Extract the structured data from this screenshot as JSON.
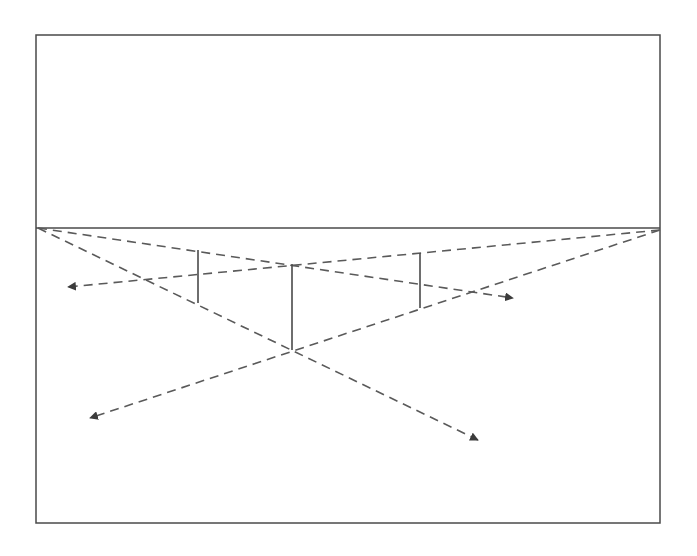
{
  "diagram": {
    "colors": {
      "background": "#ffffff",
      "frame": "#4a4a4a",
      "line": "#5a5a5a",
      "arrow": "#3c3c3c"
    },
    "frame": {
      "x": 36,
      "y": 35,
      "width": 624,
      "height": 488
    },
    "horizon": {
      "y": 228,
      "x1": 36,
      "x2": 660
    },
    "vanishing_points": [
      {
        "name": "left",
        "x": 38,
        "y": 228
      },
      {
        "name": "right",
        "x": 660,
        "y": 230
      }
    ],
    "vertical_edges": [
      {
        "name": "left-edge",
        "x": 198,
        "y1": 250,
        "y2": 303
      },
      {
        "name": "front-edge",
        "x": 292,
        "y1": 264,
        "y2": 350
      },
      {
        "name": "right-edge",
        "x": 420,
        "y1": 253,
        "y2": 308
      }
    ],
    "dashed_rays": [
      {
        "name": "vp-left-to-right-arrow",
        "x1": 38,
        "y1": 228,
        "x2": 513,
        "y2": 298
      },
      {
        "name": "vp-left-to-bottom-right-arrow",
        "x1": 38,
        "y1": 228,
        "x2": 478,
        "y2": 440
      },
      {
        "name": "vp-right-to-left-arrow",
        "x1": 660,
        "y1": 230,
        "x2": 68,
        "y2": 287
      },
      {
        "name": "vp-right-to-bottom-left-arrow",
        "x1": 660,
        "y1": 230,
        "x2": 90,
        "y2": 418
      }
    ]
  }
}
